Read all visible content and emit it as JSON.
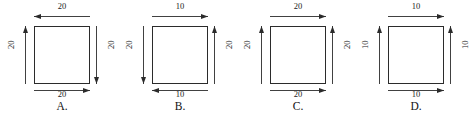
{
  "figure": {
    "type": "multiple-choice-diagram",
    "stroke_color": "#2b2b2b",
    "background_color": "#ffffff",
    "choices": [
      {
        "id": "A",
        "label": "A.",
        "shape": "square",
        "sides": {
          "top": {
            "value": "20",
            "arrow": "left"
          },
          "left": {
            "value": "20",
            "arrow": "up"
          },
          "right": {
            "value": "20",
            "arrow": "down"
          },
          "bottom": {
            "value": "20",
            "arrow": "right"
          }
        }
      },
      {
        "id": "B",
        "label": "B.",
        "shape": "square",
        "sides": {
          "top": {
            "value": "10",
            "arrow": "right"
          },
          "left": {
            "value": "20",
            "arrow": "down"
          },
          "right": {
            "value": "20",
            "arrow": "up"
          },
          "bottom": {
            "value": "10",
            "arrow": "left"
          }
        }
      },
      {
        "id": "C",
        "label": "C.",
        "shape": "square",
        "sides": {
          "top": {
            "value": "20",
            "arrow": "right"
          },
          "left": {
            "value": "20",
            "arrow": "up"
          },
          "right": {
            "value": "20",
            "arrow": "up"
          },
          "bottom": {
            "value": "20",
            "arrow": "right"
          }
        }
      },
      {
        "id": "D",
        "label": "D.",
        "shape": "square",
        "sides": {
          "top": {
            "value": "10",
            "arrow": "right"
          },
          "left": {
            "value": "10",
            "arrow": "up"
          },
          "right": {
            "value": "10",
            "arrow": "up"
          },
          "bottom": {
            "value": "10",
            "arrow": "right"
          }
        }
      }
    ]
  }
}
